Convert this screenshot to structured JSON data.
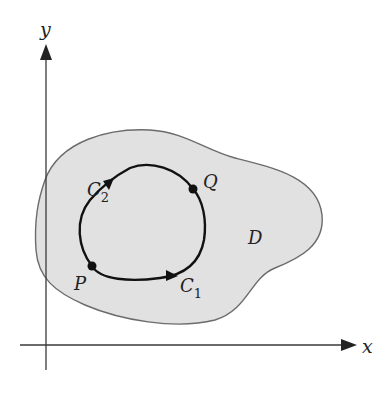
{
  "diagram": {
    "type": "line-integral-path-independence",
    "axes": {
      "x_label": "x",
      "y_label": "y"
    },
    "region": {
      "label": "D",
      "fill_color": "#e1e1e1",
      "stroke_color": "#6b6b6b"
    },
    "points": [
      {
        "name": "P",
        "label": "P"
      },
      {
        "name": "Q",
        "label": "Q"
      }
    ],
    "curves": [
      {
        "name": "C1",
        "label_main": "C",
        "label_sub": "1",
        "direction": "P to Q (lower path)"
      },
      {
        "name": "C2",
        "label_main": "C",
        "label_sub": "2",
        "direction": "P to Q (upper path)"
      }
    ],
    "colors": {
      "axis": "#3a3a3a",
      "curve": "#111111",
      "point": "#111111",
      "text": "#222222"
    }
  }
}
